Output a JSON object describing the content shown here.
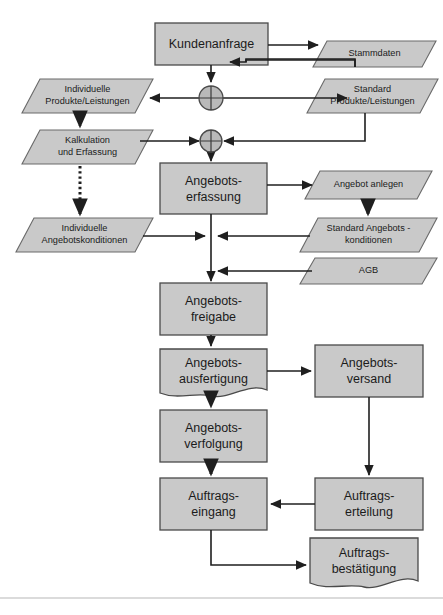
{
  "diagram": {
    "colors": {
      "shape_fill": "#c9c9c9",
      "shape_stroke": "#4a4a4a",
      "arrow": "#1f1f1f",
      "text": "#1b1b1b",
      "background": "#ffffff",
      "rule": "#b7b7b7"
    },
    "nodes": [
      {
        "id": "kundenanfrage",
        "label": "Kundenanfrage",
        "shape": "process",
        "x": 155,
        "y": 23,
        "w": 113,
        "h": 42
      },
      {
        "id": "stammdaten",
        "label": "Stammdaten",
        "shape": "data",
        "x": 313,
        "y": 41,
        "w": 123,
        "h": 26
      },
      {
        "id": "individuelle-produkte",
        "label": "Individuelle\nProdukte/Leistungen",
        "shape": "data",
        "x": 22,
        "y": 79,
        "w": 131,
        "h": 34
      },
      {
        "id": "standard-produkte",
        "label": "Standard\nProdukte/Leistungen",
        "shape": "data",
        "x": 307,
        "y": 79,
        "w": 131,
        "h": 34
      },
      {
        "id": "kalkulation-erfassung",
        "label": "Kalkulation\nund Erfassung",
        "shape": "data",
        "x": 22,
        "y": 130,
        "w": 131,
        "h": 34
      },
      {
        "id": "angebotserfassung",
        "label": "Angebots-\nerfassung",
        "shape": "process",
        "x": 160,
        "y": 163,
        "w": 107,
        "h": 51
      },
      {
        "id": "angebot-anlegen",
        "label": "Angebot anlegen",
        "shape": "data",
        "x": 305,
        "y": 171,
        "w": 127,
        "h": 28
      },
      {
        "id": "individuelle-angebotskond",
        "label": "Individuelle\nAngebotskonditionen",
        "shape": "data",
        "x": 16,
        "y": 218,
        "w": 137,
        "h": 34
      },
      {
        "id": "standard-angebotskond",
        "label": "Standard Angebots -\nkonditionen",
        "shape": "data",
        "x": 300,
        "y": 218,
        "w": 137,
        "h": 34
      },
      {
        "id": "agb",
        "label": "AGB",
        "shape": "data",
        "x": 300,
        "y": 258,
        "w": 137,
        "h": 26
      },
      {
        "id": "angebotsfreigabe",
        "label": "Angebots-\nfreigabe",
        "shape": "process",
        "x": 160,
        "y": 283,
        "w": 107,
        "h": 52
      },
      {
        "id": "angebotsausfertigung",
        "label": "Angebots-\nausfertigung",
        "shape": "document",
        "x": 160,
        "y": 349,
        "w": 107,
        "h": 49
      },
      {
        "id": "angebotsversand",
        "label": "Angebots-\nversand",
        "shape": "process",
        "x": 315,
        "y": 345,
        "w": 108,
        "h": 52
      },
      {
        "id": "angebotsverfolgung",
        "label": "Angebots-\nverfolgung",
        "shape": "process",
        "x": 160,
        "y": 410,
        "w": 107,
        "h": 52
      },
      {
        "id": "auftrags-eingang",
        "label": "Auftrags-\neingang",
        "shape": "process",
        "x": 160,
        "y": 478,
        "w": 107,
        "h": 52
      },
      {
        "id": "auftrags-erteilung",
        "label": "Auftrags-\nerteilung",
        "shape": "process",
        "x": 315,
        "y": 478,
        "w": 108,
        "h": 52
      },
      {
        "id": "auftrags-bestaetigung",
        "label": "Auftrags-\nbestätigung",
        "shape": "document",
        "x": 310,
        "y": 538,
        "w": 108,
        "h": 52
      }
    ],
    "connectors": [
      {
        "id": "xor-1",
        "type": "xor",
        "cx": 211,
        "cy": 98,
        "r": 12
      },
      {
        "id": "xor-2",
        "type": "xor",
        "cx": 211,
        "cy": 141,
        "r": 11
      }
    ],
    "edges": [
      {
        "id": "e-kundenanfrage-stammdaten",
        "from": "kundenanfrage",
        "to": "stammdaten",
        "style": "solid"
      },
      {
        "id": "e-stammdaten-kundenanfrage",
        "from": "stammdaten",
        "to": "kundenanfrage",
        "style": "solid"
      },
      {
        "id": "e-kundenanfrage-xor1",
        "from": "kundenanfrage",
        "to": "xor-1",
        "style": "solid"
      },
      {
        "id": "e-xor1-individuelle-produkte",
        "from": "xor-1",
        "to": "individuelle-produkte",
        "style": "solid"
      },
      {
        "id": "e-xor1-standard-produkte",
        "from": "xor-1",
        "to": "standard-produkte",
        "style": "solid"
      },
      {
        "id": "e-individuelle-produkte-kalkulation",
        "from": "individuelle-produkte",
        "to": "kalkulation-erfassung",
        "style": "dotted"
      },
      {
        "id": "e-kalkulation-xor2",
        "from": "kalkulation-erfassung",
        "to": "xor-2",
        "style": "solid"
      },
      {
        "id": "e-standard-produkte-xor2",
        "from": "standard-produkte",
        "to": "xor-2",
        "style": "solid"
      },
      {
        "id": "e-xor2-angebotserfassung",
        "from": "xor-2",
        "to": "angebotserfassung",
        "style": "solid"
      },
      {
        "id": "e-kalkulation-individuelle-kond",
        "from": "kalkulation-erfassung",
        "to": "individuelle-angebotskond",
        "style": "dotted"
      },
      {
        "id": "e-angebotserfassung-angebot-anlegen",
        "from": "angebotserfassung",
        "to": "angebot-anlegen",
        "style": "solid"
      },
      {
        "id": "e-angebot-anlegen-standard-kond",
        "from": "angebot-anlegen",
        "to": "standard-angebotskond",
        "style": "dotted"
      },
      {
        "id": "e-individuelle-kond-trunk",
        "from": "individuelle-angebotskond",
        "to": "angebotsfreigabe",
        "style": "solid"
      },
      {
        "id": "e-standard-kond-trunk",
        "from": "standard-angebotskond",
        "to": "angebotsfreigabe",
        "style": "solid"
      },
      {
        "id": "e-agb-trunk",
        "from": "agb",
        "to": "angebotsfreigabe",
        "style": "solid"
      },
      {
        "id": "e-angebotsfreigabe-ausfertigung",
        "from": "angebotsfreigabe",
        "to": "angebotsausfertigung",
        "style": "solid"
      },
      {
        "id": "e-ausfertigung-versand",
        "from": "angebotsausfertigung",
        "to": "angebotsversand",
        "style": "solid"
      },
      {
        "id": "e-ausfertigung-verfolgung",
        "from": "angebotsausfertigung",
        "to": "angebotsverfolgung",
        "style": "dotted"
      },
      {
        "id": "e-verfolgung-eingang",
        "from": "angebotsverfolgung",
        "to": "auftrags-eingang",
        "style": "dotted"
      },
      {
        "id": "e-versand-erteilung",
        "from": "angebotsversand",
        "to": "auftrags-erteilung",
        "style": "solid"
      },
      {
        "id": "e-erteilung-eingang",
        "from": "auftrags-erteilung",
        "to": "auftrags-eingang",
        "style": "solid"
      },
      {
        "id": "e-eingang-bestaetigung",
        "from": "auftrags-eingang",
        "to": "auftrags-bestaetigung",
        "style": "solid"
      }
    ]
  },
  "caption": {
    "text": ""
  }
}
